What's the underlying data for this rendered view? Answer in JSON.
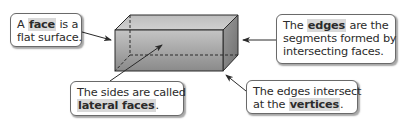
{
  "diagram": {
    "colors": {
      "prism_light": "#c8c8c8",
      "prism_dark": "#7a7a7a",
      "edge": "#2a2a2a",
      "highlight": "#d9d9d9",
      "border": "#6a6a6a"
    }
  },
  "callouts": {
    "face": {
      "pre": "A ",
      "term": "face",
      "post": " is a",
      "line2": "flat surface."
    },
    "edges": {
      "pre": "The ",
      "term": "edges",
      "post": " are the",
      "line2": "segments formed by",
      "line3": "intersecting faces."
    },
    "lateral": {
      "line1": "The sides are called",
      "term": "lateral faces",
      "post": "."
    },
    "vertices": {
      "line1": "The edges intersect",
      "pre": "at the ",
      "term": "vertices",
      "post": "."
    }
  }
}
